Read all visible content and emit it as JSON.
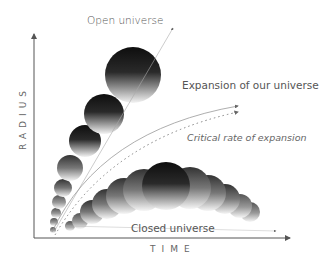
{
  "diagram": {
    "labels": {
      "open_universe": "Open universe",
      "expansion": "Expansion of our universe",
      "critical": "Critical rate of expansion",
      "closed_universe": "Closed universe"
    },
    "axes": {
      "x_label": "TIME",
      "y_label": "RADIUS"
    },
    "colors": {
      "axis": "#555555",
      "bubble_dark": "#111111",
      "bubble_light": "#f2f2f2",
      "curve": "#999999",
      "text": "#555555"
    }
  }
}
